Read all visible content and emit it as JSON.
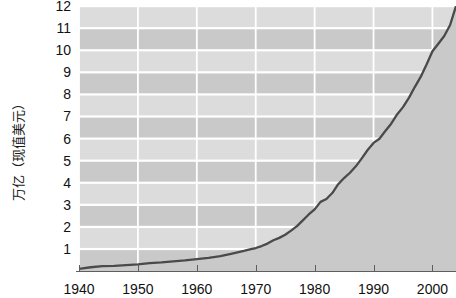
{
  "chart_data": {
    "type": "area",
    "title": "",
    "subtitle": "",
    "xlabel": "",
    "ylabel": "万亿（现值美元）",
    "xlim": [
      1940,
      2004
    ],
    "ylim": [
      0,
      12
    ],
    "grid": true,
    "legend": null,
    "x_ticks": [
      1940,
      1950,
      1960,
      1970,
      1980,
      1990,
      2000
    ],
    "x_tick_labels": [
      "1940",
      "1950",
      "1960",
      "1970",
      "1980",
      "1990",
      "2000"
    ],
    "y_ticks": [
      1,
      2,
      3,
      4,
      5,
      6,
      7,
      8,
      9,
      10,
      11,
      12
    ],
    "y_tick_labels": [
      "1",
      "2",
      "3",
      "4",
      "5",
      "6",
      "7",
      "8",
      "9",
      "10",
      "11",
      "12"
    ],
    "series": [
      {
        "name": "万亿（现值美元）",
        "line_color": "#4a4a4a",
        "fill_color": "#c9c9c9",
        "x": [
          1940,
          1942,
          1944,
          1946,
          1948,
          1950,
          1952,
          1954,
          1956,
          1958,
          1960,
          1962,
          1964,
          1966,
          1968,
          1969,
          1970,
          1971,
          1972,
          1973,
          1974,
          1975,
          1976,
          1977,
          1978,
          1979,
          1980,
          1981,
          1982,
          1983,
          1984,
          1985,
          1986,
          1987,
          1988,
          1989,
          1990,
          1991,
          1992,
          1993,
          1994,
          1995,
          1996,
          1997,
          1998,
          1999,
          2000,
          2001,
          2002,
          2003,
          2004
        ],
        "values": [
          0.1,
          0.17,
          0.22,
          0.23,
          0.27,
          0.3,
          0.36,
          0.39,
          0.44,
          0.48,
          0.54,
          0.59,
          0.67,
          0.79,
          0.91,
          0.98,
          1.04,
          1.13,
          1.24,
          1.39,
          1.5,
          1.64,
          1.83,
          2.03,
          2.29,
          2.56,
          2.79,
          3.13,
          3.26,
          3.53,
          3.93,
          4.21,
          4.45,
          4.74,
          5.1,
          5.48,
          5.8,
          5.99,
          6.34,
          6.67,
          7.09,
          7.42,
          7.84,
          8.33,
          8.79,
          9.35,
          9.95,
          10.29,
          10.64,
          11.14,
          12.0
        ]
      }
    ],
    "colors": {
      "line": "#4a4a4a",
      "area_fill": "#c9c9c9",
      "plot_background": "#cfcfcf",
      "band_light": "#dcdcdc",
      "band_dark": "#c9c9c9",
      "gridline": "#ffffff",
      "axis": "#5e5e5e",
      "text": "#111111",
      "page_background": "#ffffff"
    }
  }
}
